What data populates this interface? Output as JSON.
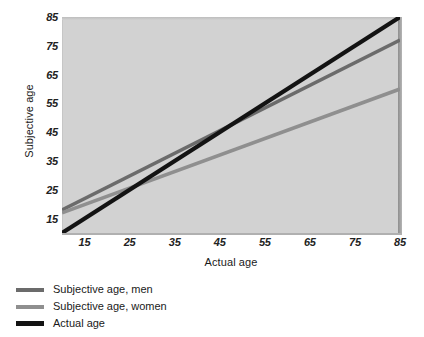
{
  "chart_data": {
    "type": "line",
    "title": "",
    "xlabel": "Actual age",
    "ylabel": "Subjective age",
    "xlim": [
      10,
      85
    ],
    "ylim": [
      10,
      85
    ],
    "xticks": [
      15,
      25,
      35,
      45,
      55,
      65,
      75,
      85
    ],
    "yticks": [
      15,
      25,
      35,
      45,
      55,
      65,
      75,
      85
    ],
    "xtick_labels": [
      "15",
      "25",
      "35",
      "45",
      "55",
      "65",
      "75",
      "85"
    ],
    "ytick_labels": [
      "15",
      "25",
      "35",
      "45",
      "55",
      "65",
      "75",
      "85"
    ],
    "grid": false,
    "legend_position": "below-left",
    "plot_background": "#d2d2d2",
    "series": [
      {
        "name": "Subjective age, men",
        "color": "#6b6b6b",
        "x": [
          10,
          85
        ],
        "values": [
          18,
          77
        ],
        "slope": 0.787,
        "intercept": 10.13
      },
      {
        "name": "Subjective age, women",
        "color": "#8f8f8f",
        "x": [
          10,
          85
        ],
        "values": [
          17,
          60
        ],
        "slope": 0.573,
        "intercept": 11.27
      },
      {
        "name": "Actual age",
        "color": "#131313",
        "x": [
          10,
          85
        ],
        "values": [
          10,
          85
        ],
        "slope": 1.0,
        "intercept": 0.0
      }
    ]
  },
  "axes": {
    "y_title": "Subjective age",
    "x_title": "Actual age"
  },
  "legend": {
    "items": [
      {
        "label": "Subjective age, men",
        "color": "#6b6b6b"
      },
      {
        "label": "Subjective age, women",
        "color": "#8f8f8f"
      },
      {
        "label": "Actual age",
        "color": "#131313"
      }
    ]
  }
}
